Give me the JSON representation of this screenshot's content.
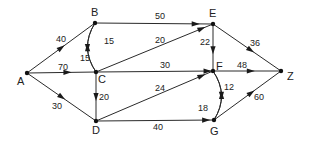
{
  "diagram": {
    "type": "directed-weighted-graph",
    "nodes": [
      {
        "id": "A",
        "label": "A"
      },
      {
        "id": "B",
        "label": "B"
      },
      {
        "id": "C",
        "label": "C"
      },
      {
        "id": "D",
        "label": "D"
      },
      {
        "id": "E",
        "label": "E"
      },
      {
        "id": "F",
        "label": "F"
      },
      {
        "id": "G",
        "label": "G"
      },
      {
        "id": "Z",
        "label": "Z"
      }
    ],
    "edges": [
      {
        "from": "A",
        "to": "B",
        "weight": "40"
      },
      {
        "from": "A",
        "to": "C",
        "weight": "70"
      },
      {
        "from": "A",
        "to": "D",
        "weight": "30"
      },
      {
        "from": "B",
        "to": "E",
        "weight": "50"
      },
      {
        "from": "B",
        "to": "C",
        "weight": "15"
      },
      {
        "from": "C",
        "to": "B",
        "weight": "15"
      },
      {
        "from": "C",
        "to": "E",
        "weight": "20"
      },
      {
        "from": "C",
        "to": "F",
        "weight": "30"
      },
      {
        "from": "C",
        "to": "D",
        "weight": "20"
      },
      {
        "from": "D",
        "to": "F",
        "weight": "24"
      },
      {
        "from": "D",
        "to": "G",
        "weight": "40"
      },
      {
        "from": "E",
        "to": "F",
        "weight": "22"
      },
      {
        "from": "E",
        "to": "Z",
        "weight": "36"
      },
      {
        "from": "F",
        "to": "Z",
        "weight": "48"
      },
      {
        "from": "F",
        "to": "G",
        "weight": "12"
      },
      {
        "from": "G",
        "to": "F",
        "weight": "18"
      },
      {
        "from": "G",
        "to": "Z",
        "weight": "60"
      }
    ]
  }
}
